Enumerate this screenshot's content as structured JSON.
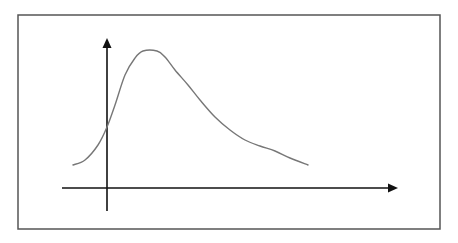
{
  "diagram": {
    "colors": {
      "background": "#ffffff",
      "frame": "#555555",
      "axes": "#111111",
      "curve": "#777777"
    },
    "frame": {
      "x": 18,
      "y": 15,
      "width": 422,
      "height": 214
    },
    "y_axis": {
      "x": 107,
      "y_top": 38,
      "y_bottom": 211,
      "arrow": "up"
    },
    "x_axis": {
      "y": 188,
      "x_left": 62,
      "x_right": 398,
      "arrow": "right"
    },
    "curve": {
      "shape": "right-skewed unimodal",
      "points": [
        [
          73,
          165
        ],
        [
          85,
          160
        ],
        [
          98,
          145
        ],
        [
          107,
          127
        ],
        [
          115,
          105
        ],
        [
          125,
          75
        ],
        [
          135,
          58
        ],
        [
          143,
          51
        ],
        [
          157,
          51
        ],
        [
          165,
          57
        ],
        [
          175,
          70
        ],
        [
          188,
          85
        ],
        [
          200,
          100
        ],
        [
          215,
          117
        ],
        [
          230,
          130
        ],
        [
          245,
          140
        ],
        [
          260,
          146
        ],
        [
          275,
          151
        ],
        [
          290,
          158
        ],
        [
          308,
          165
        ]
      ]
    },
    "labels": []
  }
}
